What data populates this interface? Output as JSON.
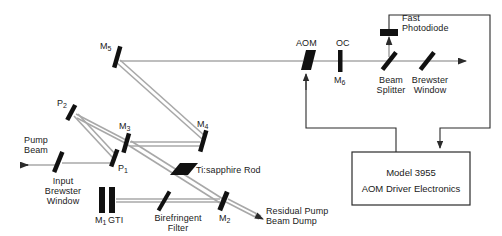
{
  "diagram": {
    "colors": {
      "beam": "#a8a8a8",
      "optic": "#111111",
      "wire": "#2b2b2b",
      "background": "#ffffff",
      "text": "#1a1a1a"
    },
    "labels": {
      "m5": "M",
      "m5_sub": "5",
      "m4": "M",
      "m4_sub": "4",
      "m3": "M",
      "m3_sub": "3",
      "m2": "M",
      "m2_sub": "2",
      "m1": "M",
      "m1_sub": "1",
      "m6": "M",
      "m6_sub": "6",
      "p1": "P",
      "p1_sub": "1",
      "p2": "P",
      "p2_sub": "2",
      "gti": "GTI",
      "aom": "AOM",
      "oc": "OC",
      "pump_beam": "Pump\nBeam",
      "input_brewster_window": "Input\nBrewster\nWindow",
      "ti_sapphire_rod": "Ti:sapphire Rod",
      "birefringent_filter": "Birefringent\nFilter",
      "residual_pump_beam_dump": "Residual Pump\nBeam Dump",
      "fast_photodiode": "Fast\nPhotodiode",
      "beam_splitter": "Beam\nSplitter",
      "brewster_window": "Brewster\nWindow"
    },
    "driver_box": {
      "line1": "Model 3955",
      "line2": "AOM Driver Electronics"
    }
  }
}
